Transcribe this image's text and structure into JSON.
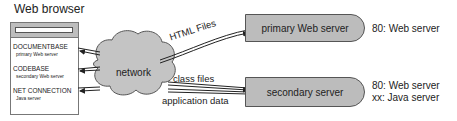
{
  "browser": {
    "title": "Web browser",
    "fields": [
      {
        "label": "DOCUMENTBASE",
        "value": "primary Web server"
      },
      {
        "label": "CODEBASE",
        "value": "secondary Web server"
      },
      {
        "label": "NET CONNECTION",
        "value": "Java server"
      }
    ]
  },
  "network": {
    "label": "network"
  },
  "edges": {
    "html_files": "HTML Files",
    "class_files": "class files",
    "application_data": "application data"
  },
  "servers": [
    {
      "name": "primary Web server",
      "ports": [
        "80: Web server"
      ]
    },
    {
      "name": "secondary server",
      "ports": [
        "80: Web server",
        "xx: Java server"
      ]
    }
  ],
  "colors": {
    "server_fill": "#bcbcbc",
    "network_fill": "#c4c4c4",
    "stroke": "#333333"
  }
}
